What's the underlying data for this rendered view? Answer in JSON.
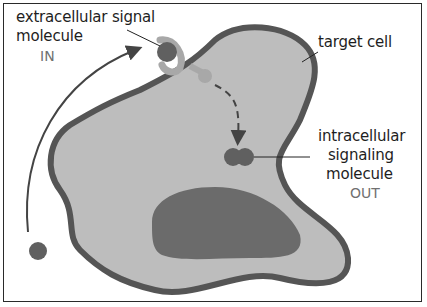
{
  "labels": {
    "signal_line1": "extracellular signal",
    "signal_line2": "molecule",
    "in": "IN",
    "target_cell": "target cell",
    "intra_line1": "intracellular",
    "intra_line2": "signaling",
    "intra_line3": "molecule",
    "out": "OUT"
  },
  "colors": {
    "membrane": "#555555",
    "cytoplasm": "#bdbdbd",
    "nucleus": "#6b6b6b",
    "molecule": "#606060",
    "receptor": "#a8a8a8"
  }
}
